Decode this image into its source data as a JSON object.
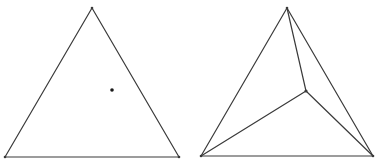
{
  "figures": [
    {
      "name": "triangle-with-interior-point",
      "vertices": {
        "apex": [
          92,
          8
        ],
        "bottom_left": [
          5,
          157
        ],
        "bottom_right": [
          179,
          157
        ]
      },
      "interior_point": [
        112,
        90
      ],
      "edges": [
        [
          "apex",
          "bottom_left"
        ],
        [
          "apex",
          "bottom_right"
        ],
        [
          "bottom_left",
          "bottom_right"
        ]
      ]
    },
    {
      "name": "triangle-subdivided-by-interior-vertex",
      "vertices": {
        "apex": [
          287,
          8
        ],
        "bottom_left": [
          201,
          156
        ],
        "bottom_right": [
          373,
          156
        ],
        "interior": [
          306,
          91
        ]
      },
      "edges": [
        [
          "apex",
          "bottom_left"
        ],
        [
          "apex",
          "bottom_right"
        ],
        [
          "bottom_left",
          "bottom_right"
        ],
        [
          "apex",
          "interior"
        ],
        [
          "bottom_left",
          "interior"
        ],
        [
          "bottom_right",
          "interior"
        ]
      ]
    }
  ],
  "colors": {
    "edge": "#3a3a3a",
    "point": "#1a1a1a",
    "background": "#ffffff"
  }
}
